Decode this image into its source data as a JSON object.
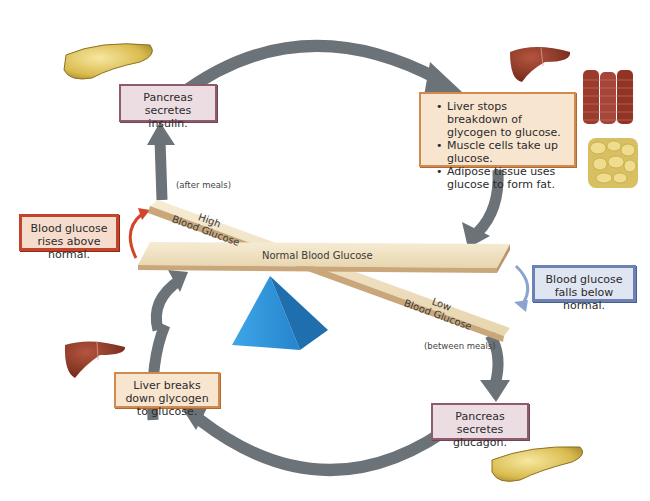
{
  "diagram": {
    "type": "feedback-loop"
  },
  "center": {
    "normal_beam_label": "Normal Blood Glucose",
    "high_beam_label": [
      "High",
      "Blood Glucose"
    ],
    "low_beam_label": [
      "Low",
      "Blood Glucose"
    ],
    "after_meals": "(after meals)",
    "between_meals": "(between meals)"
  },
  "stimuli": {
    "rise": "Blood glucose rises above normal.",
    "fall": "Blood glucose falls below normal."
  },
  "steps": {
    "insulin": "Pancreas secretes insulin.",
    "insulin_effects": [
      "Liver stops breakdown of glycogen to glucose.",
      "Muscle cells take up glucose.",
      "Adipose tissue uses glucose to form fat."
    ],
    "glucagon": "Pancreas secretes glucagon.",
    "glucagon_effect": "Liver breaks down glycogen to glucose."
  },
  "icons": {
    "pancreas": "pancreas-icon",
    "liver": "liver-icon",
    "muscle": "muscle-tissue-icon",
    "adipose": "adipose-tissue-icon",
    "fulcrum": "fulcrum-icon"
  },
  "colors": {
    "loop_arrow": "#6b7278",
    "beam": "#efe2c4",
    "beam_edge": "#c9a77a",
    "fulcrum": "#2f8fd4",
    "rise_arrow": "#d2452b",
    "fall_arrow": "#8aa4cf"
  }
}
